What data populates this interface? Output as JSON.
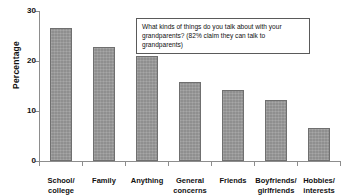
{
  "chart_data": {
    "type": "bar",
    "title": "",
    "xlabel": "",
    "ylabel": "Percentage",
    "ylim": [
      0,
      30
    ],
    "yticks": [
      0,
      10,
      20,
      30
    ],
    "grid": false,
    "legend": "none",
    "categories": [
      "School/ college",
      "Family",
      "Anything",
      "General concerns",
      "Friends",
      "Boyfriends/ girlfriends",
      "Hobbies/ interests"
    ],
    "category_lines": [
      [
        "School/",
        "college"
      ],
      [
        "Family",
        ""
      ],
      [
        "Anything",
        ""
      ],
      [
        "General",
        "concerns"
      ],
      [
        "Friends",
        ""
      ],
      [
        "Boyfriends/",
        "girlfriends"
      ],
      [
        "Hobbies/",
        "interests"
      ]
    ],
    "values": [
      26.7,
      22.8,
      21.0,
      15.8,
      14.3,
      12.2,
      6.7
    ],
    "bar_color": "#8f8f8f",
    "bar_edge_color": "#6f6f6f",
    "axis_color": "#8d8d8d"
  },
  "annotation": {
    "line1": "What kinds of things do you talk about with your",
    "line2": "grandparents? (82% claim they can talk to grandparents)"
  },
  "axis": {
    "y_title": "Percentage",
    "y_tick_labels": [
      "0",
      "10",
      "20",
      "30"
    ]
  }
}
